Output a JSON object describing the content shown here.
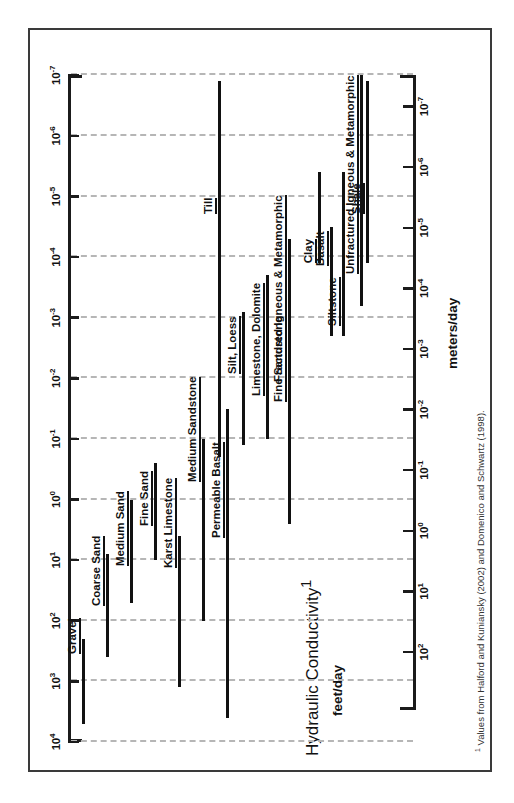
{
  "figure": {
    "title": "Hydraulic Conductivity",
    "title_superscript": "1",
    "left_axis_label": "feet/day",
    "right_axis_label": "meters/day",
    "footnote_marker": "1",
    "footnote": "Values from Halford and Kuniansky (2002) and Domenico and Schwartz (1998)."
  },
  "chart_data": {
    "type": "bar",
    "orientation": "vertical-ranges",
    "title": "Hydraulic Conductivity",
    "xlabel": "",
    "ylabel": "feet/day",
    "ylabel_secondary": "meters/day",
    "scale": "log10",
    "grid": true,
    "legend": "none",
    "axis_feet_per_day": {
      "label": "feet/day",
      "ticks": [
        "10^4",
        "10^3",
        "10^2",
        "10^1",
        "10^0",
        "10^-1",
        "10^-2",
        "10^-3",
        "10^-4",
        "10^-5",
        "10^-6",
        "10^-7"
      ],
      "tick_exponents": [
        4,
        3,
        2,
        1,
        0,
        -1,
        -2,
        -3,
        -4,
        -5,
        -6,
        -7
      ],
      "ylim_exponents": [
        -7,
        4
      ]
    },
    "axis_meters_per_day": {
      "label": "meters/day",
      "ticks": [
        "10^3",
        "10^2",
        "10^1",
        "10^0",
        "10^-1",
        "10^-2",
        "10^-3",
        "10^-4",
        "10^-5",
        "10^-6",
        "10^-7"
      ],
      "tick_exponents": [
        3,
        2,
        1,
        0,
        -1,
        -2,
        -3,
        -4,
        -5,
        -6,
        -7
      ],
      "conversion_note": "1 foot/day = 0.3048 meters/day"
    },
    "units": "feet/day (log10 exponents)",
    "categories": [
      "Gravel",
      "Coarse Sand",
      "Medium Sand",
      "Fine Sand",
      "Till",
      "Silt, Loess",
      "Limestone, Dolomite",
      "Fine Sandstone",
      "Clay",
      "Siltstone",
      "Shale",
      "Karst Limestone",
      "Medium Sandstone",
      "Basalt",
      "Permeable Basalt",
      "Fractured Igneous & Metamorphic",
      "Unfractured Igneous & Metamorphic"
    ],
    "ranges": [
      {
        "name": "Gravel",
        "min_exp": 2.3,
        "max_exp": 3.7
      },
      {
        "name": "Coarse Sand",
        "min_exp": 0.9,
        "max_exp": 2.6
      },
      {
        "name": "Medium Sand",
        "min_exp": 0.0,
        "max_exp": 1.7
      },
      {
        "name": "Fine Sand",
        "min_exp": -0.6,
        "max_exp": 1.0
      },
      {
        "name": "Till",
        "min_exp": -6.9,
        "max_exp": -0.7
      },
      {
        "name": "Silt, Loess",
        "min_exp": -3.1,
        "max_exp": -0.9
      },
      {
        "name": "Limestone, Dolomite",
        "min_exp": -3.7,
        "max_exp": -1.0
      },
      {
        "name": "Fine Sandstone",
        "min_exp": -4.1,
        "max_exp": -1.0
      },
      {
        "name": "Clay",
        "min_exp": -5.4,
        "max_exp": -3.9
      },
      {
        "name": "Siltstone",
        "min_exp": -5.4,
        "max_exp": -2.7
      },
      {
        "name": "Shale",
        "min_exp": -6.9,
        "max_exp": -3.9
      },
      {
        "name": "Karst Limestone",
        "min_exp": 0.6,
        "max_exp": 3.1
      },
      {
        "name": "Medium Sandstone",
        "min_exp": -1.0,
        "max_exp": 2.0
      },
      {
        "name": "Basalt",
        "min_exp": -4.5,
        "max_exp": -2.7
      },
      {
        "name": "Permeable Basalt",
        "min_exp": -1.5,
        "max_exp": 3.6
      },
      {
        "name": "Fractured Igneous & Metamorphic",
        "min_exp": -4.3,
        "max_exp": 0.4
      },
      {
        "name": "Unfractured Igneous & Metamorphic",
        "min_exp": -7.0,
        "max_exp": -3.2
      }
    ]
  },
  "ticks_feet": [
    {
      "label": "10",
      "exp": "4"
    },
    {
      "label": "10",
      "exp": "3"
    },
    {
      "label": "10",
      "exp": "2"
    },
    {
      "label": "10",
      "exp": "1"
    },
    {
      "label": "10",
      "exp": "0"
    },
    {
      "label": "10",
      "exp": "-1"
    },
    {
      "label": "10",
      "exp": "-2"
    },
    {
      "label": "10",
      "exp": "-3"
    },
    {
      "label": "10",
      "exp": "-4"
    },
    {
      "label": "10",
      "exp": "-5"
    },
    {
      "label": "10",
      "exp": "-6"
    },
    {
      "label": "10",
      "exp": "-7"
    }
  ],
  "ticks_meters": [
    {
      "label": "10",
      "exp": "3"
    },
    {
      "label": "10",
      "exp": "2"
    },
    {
      "label": "10",
      "exp": "1"
    },
    {
      "label": "10",
      "exp": "0"
    },
    {
      "label": "10",
      "exp": "-1"
    },
    {
      "label": "10",
      "exp": "-2"
    },
    {
      "label": "10",
      "exp": "-3"
    },
    {
      "label": "10",
      "exp": "-4"
    },
    {
      "label": "10",
      "exp": "-5"
    },
    {
      "label": "10",
      "exp": "-6"
    },
    {
      "label": "10",
      "exp": "-7"
    }
  ]
}
